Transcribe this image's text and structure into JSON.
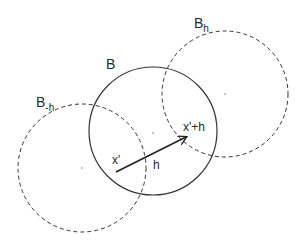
{
  "diagram": {
    "labels": {
      "ball": "B",
      "ball_plus": "B",
      "ball_plus_sub": "h",
      "ball_minus": "B",
      "ball_minus_sub": "-h",
      "start_point": "x'",
      "vector": "h",
      "end_point": "x'+h"
    },
    "colors": {
      "stroke": "#333333",
      "background": "#ffffff"
    }
  }
}
